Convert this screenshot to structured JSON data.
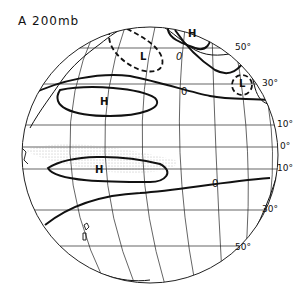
{
  "figure": {
    "title": "A 200mb",
    "panel_label": "A",
    "level": "200mb"
  },
  "latitude_labels": [
    "50°",
    "30°",
    "10°",
    "0°",
    "10°",
    "30°",
    "50°"
  ],
  "pressure_centers": [
    {
      "label": "H",
      "region": "north-pacific-high"
    },
    {
      "label": "L",
      "region": "north-pacific-low"
    },
    {
      "label": "H",
      "region": "northern-subtropical-high"
    },
    {
      "label": "H",
      "region": "southern-subtropical-high"
    },
    {
      "label": "L",
      "region": "gulf-low"
    }
  ],
  "contour_labels": [
    "0",
    "0",
    "0",
    "0"
  ],
  "colors": {
    "line": "#111111",
    "grid": "#222222",
    "background": "#ffffff",
    "stipple": "#777777"
  }
}
